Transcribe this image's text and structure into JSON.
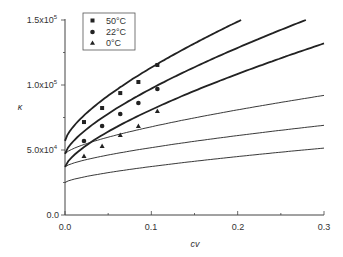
{
  "chart_data": {
    "type": "scatter",
    "title": "",
    "xlabel": "cv",
    "ylabel": "κ",
    "xlim": [
      0,
      0.3
    ],
    "ylim": [
      0,
      150000
    ],
    "grid": false,
    "legend_position": "upper-left",
    "x_ticks": [
      "0.0",
      "0.1",
      "0.2",
      "0.3"
    ],
    "y_ticks": [
      {
        "base": "0.0",
        "exp": ""
      },
      {
        "base": "5.0x10",
        "exp": "4"
      },
      {
        "base": "1.0x10",
        "exp": "5"
      },
      {
        "base": "1.5x10",
        "exp": "5"
      }
    ],
    "series": [
      {
        "name": "50°C",
        "marker": "square",
        "x": [
          0.022,
          0.043,
          0.064,
          0.085,
          0.107
        ],
        "y": [
          71500,
          82300,
          93800,
          102300,
          115400
        ]
      },
      {
        "name": "22°C",
        "marker": "circle",
        "x": [
          0.022,
          0.043,
          0.064,
          0.085,
          0.107
        ],
        "y": [
          56900,
          68500,
          77700,
          86200,
          96900
        ]
      },
      {
        "name": "0°C",
        "marker": "triangle",
        "x": [
          0.022,
          0.043,
          0.064,
          0.085,
          0.107
        ],
        "y": [
          45400,
          53100,
          61500,
          68500,
          80000
        ]
      }
    ],
    "fit_curves": [
      {
        "name": "50°C fit (thick)",
        "style": "thick",
        "y0": 57000,
        "x_end": 0.204,
        "y_end": 150000
      },
      {
        "name": "22°C fit (thick)",
        "style": "thick",
        "y0": 47000,
        "x_end": 0.279,
        "y_end": 150000
      },
      {
        "name": "0°C fit (thick)",
        "style": "thick",
        "y0": 37000,
        "x_end": 0.3,
        "y_end": 132000
      },
      {
        "name": "thin curve 1",
        "style": "thin",
        "y0": 47000,
        "x_end": 0.3,
        "y_end": 92000
      },
      {
        "name": "thin curve 2",
        "style": "thin",
        "y0": 37000,
        "x_end": 0.3,
        "y_end": 69000
      },
      {
        "name": "thin curve 3",
        "style": "thin",
        "y0": 25000,
        "x_end": 0.3,
        "y_end": 51500
      }
    ],
    "legend": [
      "50°C",
      "22°C",
      "0°C"
    ]
  }
}
